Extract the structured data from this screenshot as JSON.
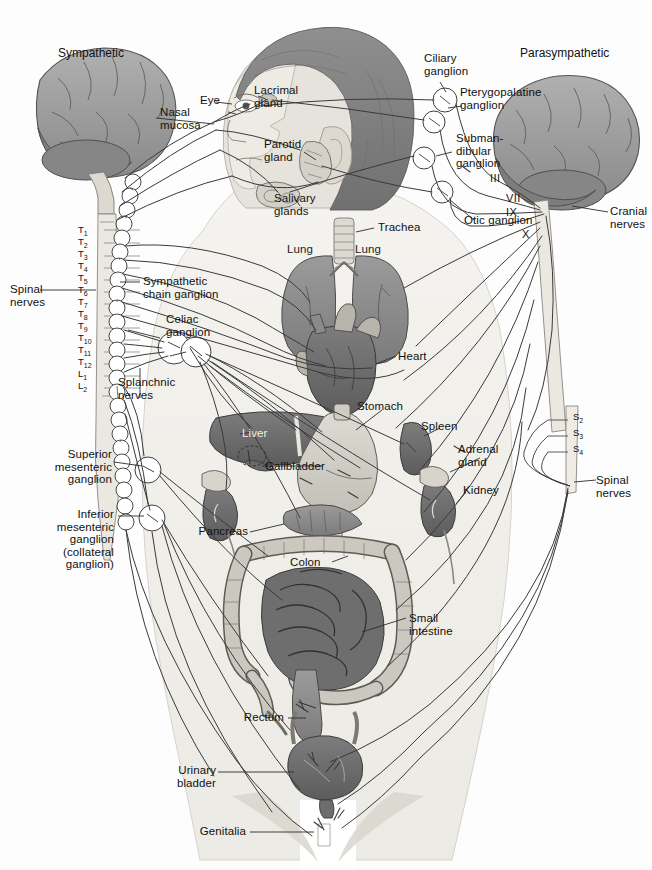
{
  "figure": {
    "headings": {
      "sympathetic": "Sympathetic",
      "parasympathetic": "Parasympathetic"
    },
    "colors": {
      "line": "#3a3a3a",
      "body_fill": "#f3f2ee",
      "brain_fill": "#9a9a9a",
      "organ_dark": "#6e6e6e",
      "organ_mid": "#8d8d8d",
      "organ_light": "#c9c7c0",
      "background": "#fdfdfd",
      "text": "#111111"
    }
  },
  "labels": {
    "sympathetic": "Sympathetic",
    "parasympathetic": "Parasympathetic",
    "nasal_mucosa": "Nasal\nmucosa",
    "eye": "Eye",
    "lacrimal_gland": "Lacrimal\ngland",
    "parotid_gland": "Parotid\ngland",
    "salivary_glands": "Salivary\nglands",
    "trachea": "Trachea",
    "ciliary_ganglion": "Ciliary\nganglion",
    "pterygopalatine_ganglion": "Pterygopalatine\nganglion",
    "submandibular_ganglion": "Subman-\ndibular\nganglion",
    "otic_ganglion": "Otic ganglion",
    "cranial_nerves": "Cranial\nnerves",
    "spinal_nerves_left": "Spinal\nnerves",
    "spinal_nerves_right": "Spinal\nnerves",
    "sympathetic_chain_ganglion": "Sympathetic\nchain ganglion",
    "celiac_ganglion": "Celiac\nganglion",
    "splanchnic_nerves": "Splanchnic\nnerves",
    "superior_mesenteric_ganglion": "Superior\nmesenteric\nganglion",
    "inferior_mesenteric_ganglion": "Inferior\nmesenteric\nganglion\n(collateral\nganglion)",
    "lung_left": "Lung",
    "lung_right": "Lung",
    "heart": "Heart",
    "stomach": "Stomach",
    "liver": "Liver",
    "gallbladder": "Gallbladder",
    "spleen": "Spleen",
    "adrenal_gland": "Adrenal\ngland",
    "kidney": "Kidney",
    "pancreas": "Pancreas",
    "colon": "Colon",
    "small_intestine": "Small\nintestine",
    "rectum": "Rectum",
    "urinary_bladder": "Urinary\nbladder",
    "genitalia": "Genitalia"
  },
  "cranial_nerve_numerals": [
    "III",
    "VII",
    "IX",
    "X"
  ],
  "spinal_segments_left": [
    "T1",
    "T2",
    "T3",
    "T4",
    "T5",
    "T6",
    "T7",
    "T8",
    "T9",
    "T10",
    "T11",
    "T12",
    "L1",
    "L2"
  ],
  "spinal_segments_right": [
    "S2",
    "S3",
    "S4"
  ]
}
